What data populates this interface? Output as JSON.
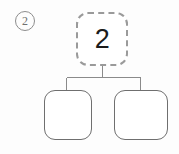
{
  "figure": {
    "step_marker": "②",
    "step_number": "2",
    "background_color": "#fdfdfd"
  },
  "tree": {
    "root": {
      "label": "2",
      "border_style": "dashed",
      "border_color": "#9a9a9a",
      "highlighted": true
    },
    "children": [
      {
        "label": "",
        "border_style": "solid",
        "border_color": "#6f6f6f",
        "position": "left"
      },
      {
        "label": "",
        "border_style": "solid",
        "border_color": "#6f6f6f",
        "position": "right"
      }
    ]
  },
  "connectors": {
    "color": "#8a8a8a",
    "stem_x": 102,
    "stem_top_y": 66,
    "bar_y": 77,
    "bar_left_x": 66,
    "bar_right_x": 140,
    "child_top_y": 90
  }
}
